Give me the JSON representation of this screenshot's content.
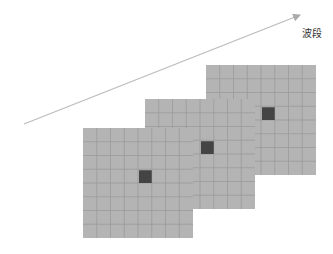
{
  "diagram": {
    "axis": {
      "label": "波段",
      "start": [
        24,
        124
      ],
      "end": [
        300,
        15
      ],
      "color": "#bbbbbb"
    },
    "grid": {
      "rows": 8,
      "cols": 8,
      "fill": "#b4b4b4",
      "line": "#9a9a9a",
      "highlight_color": "#444444",
      "highlight_cell": {
        "row": 3,
        "col": 4
      }
    },
    "layers": [
      {
        "name": "band-3",
        "x": 206,
        "y": 65,
        "size": 110
      },
      {
        "name": "band-2",
        "x": 145,
        "y": 99,
        "size": 110
      },
      {
        "name": "band-1",
        "x": 83,
        "y": 128,
        "size": 110
      }
    ]
  }
}
